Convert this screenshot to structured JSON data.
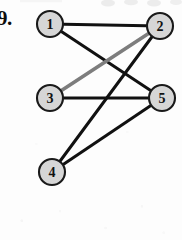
{
  "figure": {
    "label": "9.",
    "type": "undirected-graph-diagram"
  },
  "canvas": {
    "width": 182,
    "height": 240,
    "background_color": "#fdfdfd"
  },
  "style": {
    "node_fill": "#d6d6d6",
    "node_stroke": "#1a1a1a",
    "node_radius": 13,
    "node_stroke_width": 2.1,
    "edge_color_normal": "#111111",
    "edge_color_highlight": "#7d7d7d",
    "edge_width_normal": 3.0,
    "edge_width_highlight": 3.6,
    "label_color": "#111111"
  },
  "graph": {
    "nodes": [
      {
        "id": "1",
        "label": "1",
        "x": 50,
        "y": 24
      },
      {
        "id": "2",
        "label": "2",
        "x": 160,
        "y": 26
      },
      {
        "id": "3",
        "label": "3",
        "x": 50,
        "y": 98
      },
      {
        "id": "4",
        "label": "4",
        "x": 52,
        "y": 172
      },
      {
        "id": "5",
        "label": "5",
        "x": 162,
        "y": 98
      }
    ],
    "edges": [
      {
        "id": "e-1-2",
        "from": "1",
        "to": "2",
        "color": "#111111",
        "width": 3.0,
        "highlight": false
      },
      {
        "id": "e-1-5",
        "from": "1",
        "to": "5",
        "color": "#111111",
        "width": 3.0,
        "highlight": false
      },
      {
        "id": "e-2-4",
        "from": "2",
        "to": "4",
        "color": "#111111",
        "width": 3.0,
        "highlight": false
      },
      {
        "id": "e-3-2",
        "from": "3",
        "to": "2",
        "color": "#7d7d7d",
        "width": 3.6,
        "highlight": true
      },
      {
        "id": "e-3-5",
        "from": "3",
        "to": "5",
        "color": "#111111",
        "width": 3.0,
        "highlight": false
      },
      {
        "id": "e-4-5",
        "from": "4",
        "to": "5",
        "color": "#111111",
        "width": 3.0,
        "highlight": false
      }
    ]
  }
}
